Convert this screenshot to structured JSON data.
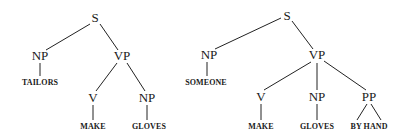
{
  "trees": [
    {
      "id": "tailors-make-gloves",
      "nodes": {
        "S": {
          "label": "S",
          "x": 95,
          "y": 22
        },
        "NP": {
          "label": "NP",
          "x": 40,
          "y": 60
        },
        "VP": {
          "label": "VP",
          "x": 122,
          "y": 60
        },
        "V": {
          "label": "V",
          "x": 93,
          "y": 102
        },
        "NP2": {
          "label": "NP",
          "x": 147,
          "y": 102
        }
      },
      "words": {
        "w1": {
          "label": "TAILORS",
          "x": 40,
          "y": 85
        },
        "w2": {
          "label": "MAKE",
          "x": 93,
          "y": 129
        },
        "w3": {
          "label": "GLOVES",
          "x": 149,
          "y": 129
        }
      }
    },
    {
      "id": "someone-make-gloves-by-hand",
      "nodes": {
        "S": {
          "label": "S",
          "x": 287,
          "y": 20
        },
        "NP": {
          "label": "NP",
          "x": 209,
          "y": 59
        },
        "VP": {
          "label": "VP",
          "x": 317,
          "y": 59
        },
        "V": {
          "label": "V",
          "x": 261,
          "y": 101
        },
        "NP2": {
          "label": "NP",
          "x": 317,
          "y": 101
        },
        "PP": {
          "label": "PP",
          "x": 369,
          "y": 101
        }
      },
      "words": {
        "w1": {
          "label": "SOMEONE",
          "x": 206,
          "y": 85
        },
        "w2": {
          "label": "MAKE",
          "x": 261,
          "y": 129
        },
        "w3": {
          "label": "GLOVES",
          "x": 317,
          "y": 129
        },
        "w4": {
          "label": "BY HAND",
          "x": 369,
          "y": 129
        }
      }
    }
  ]
}
